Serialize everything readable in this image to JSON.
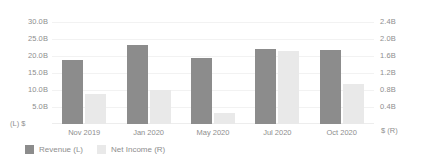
{
  "chart_data": {
    "type": "bar",
    "title": "",
    "subtitle": "",
    "xlabel": "",
    "ylabel": "",
    "grid": true,
    "legend_position": "bottom-left",
    "categories": [
      "Nov 2019",
      "Jan 2020",
      "May 2020",
      "Jul 2020",
      "Oct 2020"
    ],
    "series": [
      {
        "name": "Revenue (L)",
        "axis": "left",
        "color": "#8c8c8c",
        "values": [
          18.8,
          23.4,
          19.5,
          22.3,
          21.9
        ]
      },
      {
        "name": "Net Income (R)",
        "axis": "right",
        "color": "#e9e9e9",
        "values": [
          0.7,
          0.81,
          0.25,
          1.72,
          0.95
        ]
      }
    ],
    "left_axis": {
      "unit_label": "(L) $",
      "ylim": [
        0,
        32.5
      ],
      "ticks": [
        "30.0B",
        "25.0B",
        "20.0B",
        "15.0B",
        "10.0B",
        "5.0B"
      ],
      "tick_values": [
        30.0,
        25.0,
        20.0,
        15.0,
        10.0,
        5.0
      ]
    },
    "right_axis": {
      "unit_label": "$ (R)",
      "ylim": [
        0,
        2.6
      ],
      "ticks": [
        "2.4B",
        "2.0B",
        "1.6B",
        "1.2B",
        "0.8B",
        "0.4B"
      ],
      "tick_values": [
        2.4,
        2.0,
        1.6,
        1.2,
        0.8,
        0.4
      ]
    }
  },
  "legend": {
    "items": [
      {
        "label": "Revenue (L)",
        "color": "#8c8c8c"
      },
      {
        "label": "Net Income (R)",
        "color": "#e9e9e9"
      }
    ]
  },
  "colors": {
    "background": "#ffffff",
    "gridline": "#f2f2f2",
    "text": "#8e8e8e",
    "revenue": "#8c8c8c",
    "net_income": "#e9e9e9"
  }
}
